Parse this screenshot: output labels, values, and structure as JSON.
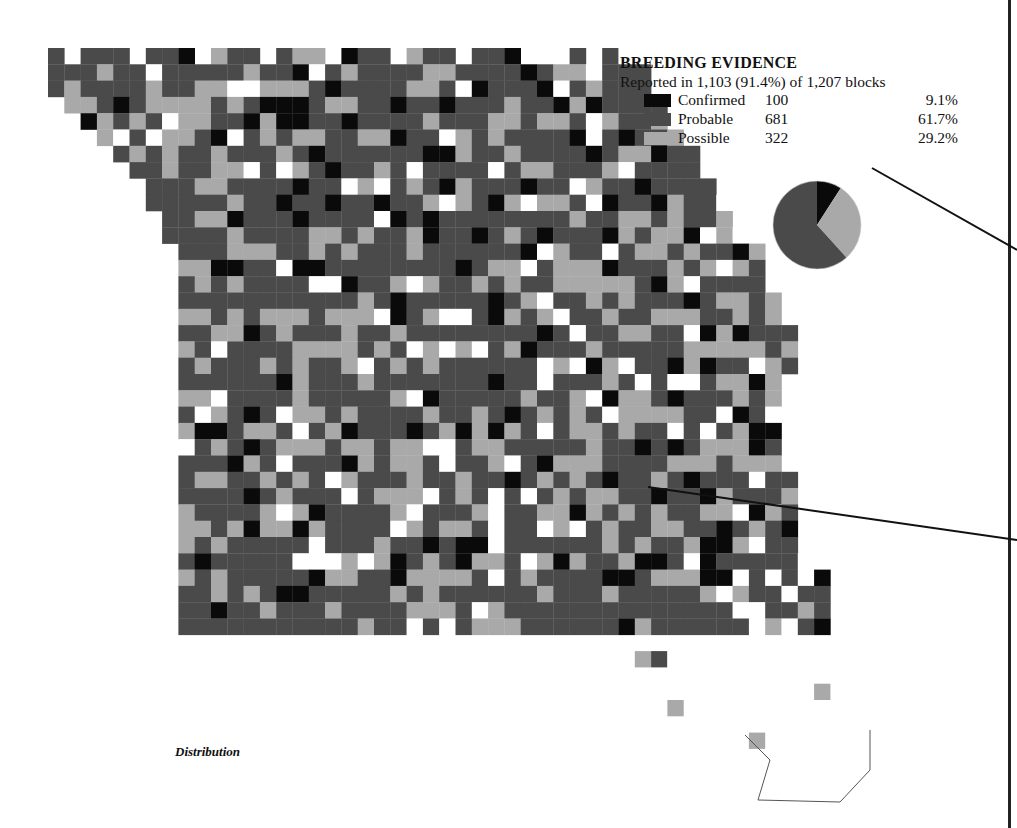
{
  "legend": {
    "title": "BREEDING EVIDENCE",
    "subtitle": "Reported in 1,103 (91.4%) of 1,207 blocks",
    "categories": [
      {
        "label": "Confirmed",
        "count": "100",
        "percent": "9.1%",
        "color": "#0a0a0a"
      },
      {
        "label": "Probable",
        "count": "681",
        "percent": "61.7%",
        "color": "#4a4a4a"
      },
      {
        "label": "Possible",
        "count": "322",
        "percent": "29.2%",
        "color": "#a9a9a9"
      }
    ]
  },
  "caption": "Distribution",
  "pie": {
    "slices": [
      9.1,
      29.2,
      61.7
    ],
    "colors": [
      "#0a0a0a",
      "#a9a9a9",
      "#4a4a4a"
    ]
  },
  "map": {
    "cell": 16.3,
    "origin": [
      48,
      48
    ],
    "rows": [
      [
        0,
        0,
        2
      ],
      [
        0,
        0,
        2
      ],
      [
        0,
        0,
        3
      ],
      [
        1,
        0,
        2
      ],
      [
        2,
        0,
        3
      ],
      [
        2,
        1,
        3
      ],
      [
        3,
        1,
        4
      ],
      [
        3,
        1,
        6
      ],
      [
        4,
        2,
        6
      ],
      [
        4,
        3,
        6
      ],
      [
        5,
        3,
        8
      ],
      [
        5,
        4,
        8
      ],
      [
        8,
        4,
        9
      ],
      [
        8,
        4,
        9
      ],
      [
        8,
        4,
        10
      ],
      [
        8,
        4,
        10
      ],
      [
        8,
        5,
        11
      ],
      [
        8,
        5,
        13
      ],
      [
        8,
        5,
        13
      ],
      [
        8,
        5,
        14
      ],
      [
        8,
        5,
        15
      ],
      [
        8,
        5,
        16
      ],
      [
        8,
        5,
        16
      ],
      [
        8,
        5,
        17
      ],
      [
        8,
        5,
        17
      ],
      [
        8,
        5,
        17
      ],
      [
        8,
        5,
        18
      ],
      [
        8,
        5,
        18
      ],
      [
        8,
        5,
        18
      ],
      [
        8,
        5,
        19
      ],
      [
        8,
        5,
        19
      ],
      [
        8,
        5,
        19
      ],
      [
        8,
        5,
        19
      ],
      [
        8,
        5,
        20
      ],
      [
        8,
        5,
        21
      ],
      [
        8,
        5,
        22
      ],
      [
        8,
        5,
        23
      ],
      [
        8,
        5,
        23
      ],
      [
        8,
        5,
        23
      ],
      [
        8,
        5,
        24
      ],
      [
        46,
        43,
        0
      ],
      [
        46,
        46,
        0
      ],
      [
        47,
        46,
        0
      ]
    ],
    "colors": {
      "0": "#ffffff",
      "1": "#0a0a0a",
      "2": "#4a4a4a",
      "3": "#a9a9a9"
    }
  }
}
